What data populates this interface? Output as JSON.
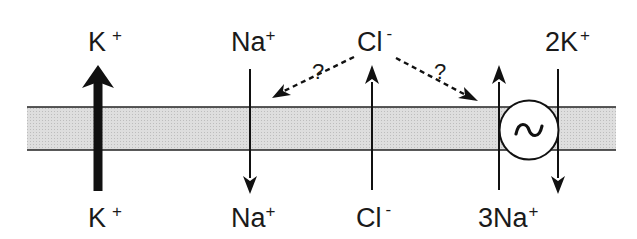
{
  "diagram": {
    "colors": {
      "membrane_fill": "#d9d9d9",
      "stroke": "#111111",
      "background": "#ffffff"
    },
    "top_labels": {
      "k": {
        "base": "K",
        "charge": "+"
      },
      "na": {
        "base": "Na",
        "charge": "+"
      },
      "cl": {
        "base": "Cl",
        "charge": "-"
      },
      "pump_k": {
        "base": "2K",
        "charge": "+"
      }
    },
    "bottom_labels": {
      "k": {
        "base": "K",
        "charge": "+"
      },
      "na": {
        "base": "Na",
        "charge": "+"
      },
      "cl": {
        "base": "Cl",
        "charge": "-"
      },
      "pump_na": {
        "base": "3Na",
        "charge": "+"
      }
    },
    "uncertain_marks": {
      "left": "?",
      "right": "?"
    },
    "pump_symbol": "~",
    "flows": [
      {
        "ion": "K+",
        "direction": "up",
        "style": "thick"
      },
      {
        "ion": "Na+",
        "direction": "down",
        "style": "thin"
      },
      {
        "ion": "Cl-",
        "direction": "up",
        "style": "thin"
      },
      {
        "ion": "3Na+",
        "direction": "up",
        "style": "thin",
        "via": "pump"
      },
      {
        "ion": "2K+",
        "direction": "down",
        "style": "thin",
        "via": "pump"
      },
      {
        "ion": "Cl-",
        "direction": "dashed to Na+ channel",
        "label": "?"
      },
      {
        "ion": "Cl-",
        "direction": "dashed to pump",
        "label": "?"
      }
    ]
  }
}
